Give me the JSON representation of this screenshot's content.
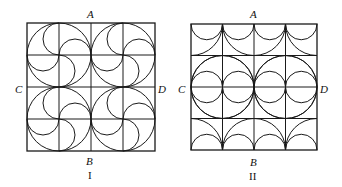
{
  "figures": [
    {
      "id": "I",
      "caption": "I",
      "labels": {
        "top": "A",
        "bottom": "B",
        "left": "C",
        "right": "D"
      },
      "square": {
        "x": 27,
        "y": 23,
        "size": 128
      },
      "grid": 4,
      "pattern": "four pinwheel circles: each 2x2 block has a circle of radius one cell with four half-cell semicircles spiraling from the center"
    },
    {
      "id": "II",
      "caption": "II",
      "labels": {
        "top": "A",
        "bottom": "B",
        "left": "C",
        "right": "D"
      },
      "square": {
        "x": 191,
        "y": 24,
        "size": 126
      },
      "grid": 4,
      "pattern": "semicircles along top and bottom edges, concave quarter arcs forming star shapes, row of four circles along line CD"
    }
  ],
  "colors": {
    "stroke": "#1a1a1a",
    "background": "#ffffff"
  }
}
